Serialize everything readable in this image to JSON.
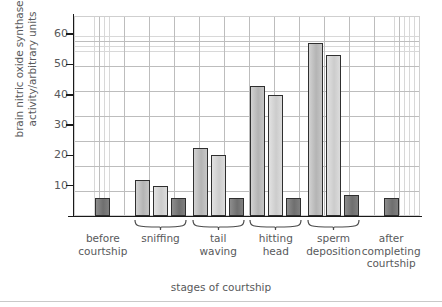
{
  "chart_data": {
    "type": "bar",
    "title": "",
    "xlabel": "stages of courtship",
    "ylabel": "brain nitric oxide synthase activity/arbitrary units",
    "ylim": [
      0,
      66
    ],
    "yticks": [
      10,
      20,
      30,
      40,
      50,
      60
    ],
    "ytick_labels": [
      "10",
      "20",
      "30",
      "40",
      "50",
      "60"
    ],
    "grid": true,
    "grid_style": "graph-paper",
    "legend": "none",
    "categories": [
      "before courtship",
      "sniffing",
      "tail waving",
      "hitting head",
      "sperm deposition",
      "after completing courtship"
    ],
    "groups": [
      {
        "category": "before courtship",
        "braced": false,
        "bars": [
          {
            "series": "control",
            "value": 6,
            "color": "#7a7a7a"
          }
        ]
      },
      {
        "category": "sniffing",
        "braced": true,
        "bars": [
          {
            "series": "measure-1",
            "value": 12,
            "color": "#bcbcbc"
          },
          {
            "series": "measure-2",
            "value": 10,
            "color": "#d6d6d6"
          },
          {
            "series": "control",
            "value": 6,
            "color": "#7a7a7a"
          }
        ]
      },
      {
        "category": "tail waving",
        "braced": true,
        "bars": [
          {
            "series": "measure-1",
            "value": 22.5,
            "color": "#bcbcbc"
          },
          {
            "series": "measure-2",
            "value": 20,
            "color": "#d6d6d6"
          },
          {
            "series": "control",
            "value": 6,
            "color": "#7a7a7a"
          }
        ]
      },
      {
        "category": "hitting head",
        "braced": true,
        "bars": [
          {
            "series": "measure-1",
            "value": 43,
            "color": "#bcbcbc"
          },
          {
            "series": "measure-2",
            "value": 40,
            "color": "#d6d6d6"
          },
          {
            "series": "control",
            "value": 6,
            "color": "#7a7a7a"
          }
        ]
      },
      {
        "category": "sperm deposition",
        "braced": true,
        "bars": [
          {
            "series": "measure-1",
            "value": 57,
            "color": "#bcbcbc"
          },
          {
            "series": "measure-2",
            "value": 53,
            "color": "#d6d6d6"
          },
          {
            "series": "control",
            "value": 7,
            "color": "#7a7a7a"
          }
        ]
      },
      {
        "category": "after completing courtship",
        "braced": false,
        "bars": [
          {
            "series": "control",
            "value": 6,
            "color": "#7a7a7a"
          }
        ]
      }
    ]
  },
  "axis": {
    "y_title": "brain nitric oxide synthase activity/arbitrary units",
    "x_title": "stages of courtship"
  },
  "category_labels": [
    {
      "lines": [
        "before",
        "courtship"
      ]
    },
    {
      "lines": [
        "sniffing"
      ]
    },
    {
      "lines": [
        "tail",
        "waving"
      ]
    },
    {
      "lines": [
        "hitting",
        "head"
      ]
    },
    {
      "lines": [
        "sperm",
        "deposition"
      ]
    },
    {
      "lines": [
        "after",
        "completing",
        "courtship"
      ]
    }
  ]
}
